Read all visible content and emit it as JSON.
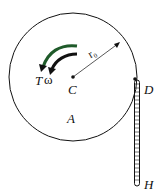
{
  "diagram": {
    "labels": {
      "torque": "T",
      "omega": "ω",
      "center": "C",
      "disk": "A",
      "contact": "D",
      "end": "H",
      "radius": "r₀"
    },
    "colors": {
      "stroke": "#111111",
      "arrow_accent": "#1f5a2a"
    }
  }
}
